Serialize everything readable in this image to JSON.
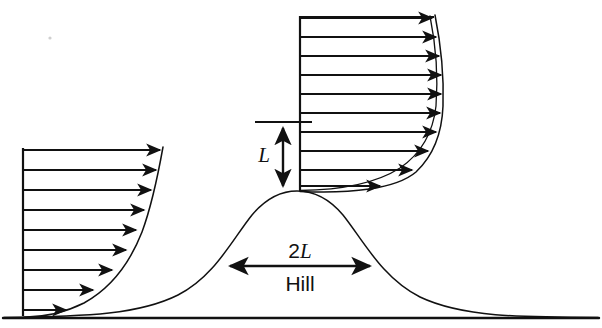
{
  "figure": {
    "name": "boundary-layer-flow-over-hill",
    "width": 602,
    "height": 328,
    "background_color": "#ffffff",
    "ink_color": "#111111"
  },
  "labels": {
    "hill_height_label": "L",
    "hill_width_label_prefix": "2",
    "hill_width_label_symbol": "L",
    "hill_name_label": "Hill"
  },
  "ground": {
    "name": "ground-line",
    "y": 318,
    "x_start": 3,
    "x_end": 599
  },
  "hill": {
    "name": "hill-profile",
    "peak_x": 297,
    "peak_y": 191,
    "base_y": 318,
    "half_width_2L_px": 144,
    "left_foot_x": 150,
    "right_foot_x": 560
  },
  "upstream_profile": {
    "name": "upstream-velocity-profile",
    "baseline_x": 23,
    "top_y": 150,
    "bottom_y": 312,
    "arrow_count": 9,
    "arrows": [
      {
        "y": 150,
        "tip_x": 160
      },
      {
        "y": 170,
        "tip_x": 156
      },
      {
        "y": 190,
        "tip_x": 151
      },
      {
        "y": 210,
        "tip_x": 144
      },
      {
        "y": 230,
        "tip_x": 136
      },
      {
        "y": 250,
        "tip_x": 126
      },
      {
        "y": 270,
        "tip_x": 112
      },
      {
        "y": 290,
        "tip_x": 93
      },
      {
        "y": 310,
        "tip_x": 66
      }
    ]
  },
  "hilltop_profile": {
    "name": "hilltop-velocity-profile",
    "baseline_x": 300,
    "top_y": 18,
    "bottom_y": 190,
    "arrow_count": 10,
    "arrows": [
      {
        "y": 18,
        "tip_x": 432
      },
      {
        "y": 37,
        "tip_x": 436
      },
      {
        "y": 56,
        "tip_x": 439
      },
      {
        "y": 75,
        "tip_x": 441
      },
      {
        "y": 94,
        "tip_x": 441
      },
      {
        "y": 113,
        "tip_x": 440
      },
      {
        "y": 132,
        "tip_x": 436
      },
      {
        "y": 151,
        "tip_x": 428
      },
      {
        "y": 170,
        "tip_x": 412
      },
      {
        "y": 186,
        "tip_x": 380
      }
    ]
  },
  "height_dimension": {
    "name": "L-height-dimension",
    "x": 283,
    "top_y": 125,
    "bottom_y": 189,
    "tick_line_x_start": 255,
    "tick_line_x_end": 312,
    "tick_line_y": 122
  },
  "width_dimension": {
    "name": "2L-width-dimension",
    "y": 266,
    "x_start": 228,
    "x_end": 372
  },
  "artifact": {
    "name": "scan-speck",
    "x": 50,
    "y": 38
  }
}
